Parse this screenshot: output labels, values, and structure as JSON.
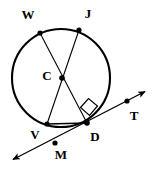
{
  "figure": {
    "background_color": "#ffffff",
    "stroke_color": "#000000",
    "circle": {
      "name": "circle-C",
      "center": {
        "x": 61,
        "y": 78
      },
      "radius": 49,
      "stroke_width": 2.1
    },
    "points": [
      {
        "id": "W",
        "label": "W",
        "x": 40,
        "y": 33,
        "label_x": 28,
        "label_y": 16,
        "dot": true
      },
      {
        "id": "J",
        "label": "J",
        "x": 79,
        "y": 30,
        "label_x": 88,
        "label_y": 15,
        "dot": true
      },
      {
        "id": "C",
        "label": "C",
        "x": 62,
        "y": 78,
        "label_x": 47,
        "label_y": 77,
        "dot": true
      },
      {
        "id": "V",
        "label": "V",
        "x": 47,
        "y": 124,
        "label_x": 35,
        "label_y": 136,
        "dot": true
      },
      {
        "id": "D",
        "label": "D",
        "x": 87,
        "y": 123,
        "label_x": 95,
        "label_y": 138,
        "dot": true
      },
      {
        "id": "M",
        "label": "M",
        "x": 55,
        "y": 143,
        "label_x": 61,
        "label_y": 156,
        "dot": true
      },
      {
        "id": "T",
        "label": "T",
        "x": 127,
        "y": 101,
        "label_x": 134,
        "label_y": 117,
        "dot": true
      }
    ],
    "segments": [
      {
        "name": "segment-W-to-D",
        "from": "W",
        "to": "D",
        "x1": 40,
        "y1": 33,
        "x2": 87,
        "y2": 123,
        "stroke_width": 1.1
      },
      {
        "name": "segment-J-to-V",
        "from": "J",
        "to": "V",
        "x1": 79,
        "y1": 30,
        "x2": 47,
        "y2": 124,
        "stroke_width": 1.1
      },
      {
        "name": "chord-V-to-D",
        "from": "V",
        "to": "D",
        "x1": 47,
        "y1": 124,
        "x2": 87,
        "y2": 123,
        "stroke_width": 1.6
      }
    ],
    "tangent_line": {
      "name": "tangent-line-through-D",
      "from_arrow_x": 10,
      "from_arrow_y": 161,
      "to_arrow_x": 148,
      "to_arrow_y": 90,
      "stroke_width": 1.3,
      "arrowheads": "both"
    },
    "right_angle_marker": {
      "name": "right-angle-marker-at-D",
      "vertex_x": 87,
      "vertex_y": 123,
      "points": "80.5,107.5 88.5,98.5 97.5,106.0 89.5,115.5",
      "stroke_width": 1.2
    }
  }
}
